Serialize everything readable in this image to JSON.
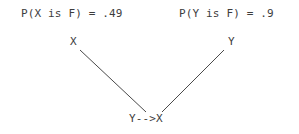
{
  "canvas": {
    "width": 299,
    "height": 134,
    "background_color": "#ffffff",
    "text_color": "#3d3d3d",
    "edge_color": "#4a4a4a"
  },
  "annotations": {
    "prob_x": "P(X is F) = .49",
    "prob_y": "P(Y is F) = .9"
  },
  "nodes": {
    "x": "X",
    "y": "Y",
    "result": "Y-->X"
  },
  "chart_data": {
    "type": "diagram",
    "title": "",
    "nodes": [
      {
        "id": "X",
        "label": "X",
        "x": 73,
        "y": 44,
        "probability_label": "P(X is F) = .49",
        "probability_value": 0.49,
        "variable": "X",
        "predicate": "F"
      },
      {
        "id": "Y",
        "label": "Y",
        "x": 231,
        "y": 44,
        "probability_label": "P(Y is F) = .9",
        "probability_value": 0.9,
        "variable": "Y",
        "predicate": "F"
      },
      {
        "id": "YX",
        "label": "Y-->X",
        "x": 151,
        "y": 120,
        "probability_label": "",
        "probability_value": null,
        "variable": "Y-->X",
        "predicate": ""
      }
    ],
    "edges": [
      {
        "from": "X",
        "to": "YX",
        "x1": 80,
        "y1": 50,
        "x2": 146,
        "y2": 112,
        "arrowhead": false
      },
      {
        "from": "Y",
        "to": "YX",
        "x1": 224,
        "y1": 50,
        "x2": 162,
        "y2": 112,
        "arrowhead": false
      }
    ],
    "layout": "v-shape-converging",
    "legend": [],
    "grid": false
  }
}
